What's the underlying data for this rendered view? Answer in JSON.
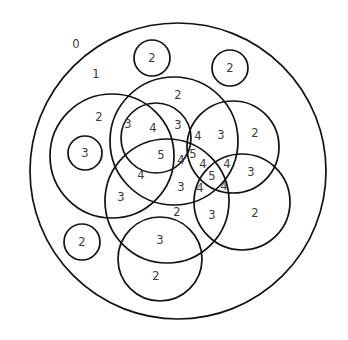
{
  "diagram": {
    "type": "overlapping circles (region depth count)",
    "stroke_color": "#111111",
    "label_color": "#3a3a3a",
    "background": "#ffffff",
    "circles": [
      {
        "id": "outer",
        "cx": 178,
        "cy": 171,
        "r": 148
      },
      {
        "id": "small-top",
        "cx": 152,
        "cy": 58,
        "r": 18
      },
      {
        "id": "small-top-right",
        "cx": 230,
        "cy": 68,
        "r": 18
      },
      {
        "id": "small-left-inner",
        "cx": 85,
        "cy": 153,
        "r": 17
      },
      {
        "id": "small-bottom-left",
        "cx": 82,
        "cy": 242,
        "r": 18
      },
      {
        "id": "left-large",
        "cx": 112,
        "cy": 156,
        "r": 62
      },
      {
        "id": "top-large",
        "cx": 174,
        "cy": 141,
        "r": 64
      },
      {
        "id": "center-small",
        "cx": 156,
        "cy": 138,
        "r": 35
      },
      {
        "id": "right-upper",
        "cx": 233,
        "cy": 147,
        "r": 46
      },
      {
        "id": "middle-large",
        "cx": 167,
        "cy": 201,
        "r": 62
      },
      {
        "id": "right-lower",
        "cx": 242,
        "cy": 202,
        "r": 48
      },
      {
        "id": "bottom",
        "cx": 160,
        "cy": 259,
        "r": 42
      }
    ],
    "labels": [
      {
        "text": "0",
        "x": 76,
        "y": 44
      },
      {
        "text": "1",
        "x": 96,
        "y": 74
      },
      {
        "text": "2",
        "x": 152,
        "y": 58
      },
      {
        "text": "2",
        "x": 230,
        "y": 68
      },
      {
        "text": "2",
        "x": 178,
        "y": 95
      },
      {
        "text": "2",
        "x": 99,
        "y": 117
      },
      {
        "text": "3",
        "x": 128,
        "y": 124
      },
      {
        "text": "4",
        "x": 153,
        "y": 128
      },
      {
        "text": "3",
        "x": 178,
        "y": 125
      },
      {
        "text": "4",
        "x": 198,
        "y": 136
      },
      {
        "text": "3",
        "x": 221,
        "y": 135
      },
      {
        "text": "2",
        "x": 255,
        "y": 133
      },
      {
        "text": "3",
        "x": 85,
        "y": 153
      },
      {
        "text": "5",
        "x": 161,
        "y": 155
      },
      {
        "text": "4",
        "x": 181,
        "y": 160
      },
      {
        "text": "5",
        "x": 193,
        "y": 154
      },
      {
        "text": "4",
        "x": 203,
        "y": 164
      },
      {
        "text": "4",
        "x": 227,
        "y": 164
      },
      {
        "text": "4",
        "x": 141,
        "y": 175
      },
      {
        "text": "5",
        "x": 212,
        "y": 176
      },
      {
        "text": "3",
        "x": 251,
        "y": 172
      },
      {
        "text": "3",
        "x": 121,
        "y": 197
      },
      {
        "text": "3",
        "x": 181,
        "y": 187
      },
      {
        "text": "4",
        "x": 200,
        "y": 188
      },
      {
        "text": "4",
        "x": 224,
        "y": 186
      },
      {
        "text": "2",
        "x": 177,
        "y": 212
      },
      {
        "text": "3",
        "x": 212,
        "y": 215
      },
      {
        "text": "2",
        "x": 255,
        "y": 213
      },
      {
        "text": "2",
        "x": 82,
        "y": 242
      },
      {
        "text": "3",
        "x": 160,
        "y": 240
      },
      {
        "text": "2",
        "x": 156,
        "y": 276
      }
    ]
  }
}
